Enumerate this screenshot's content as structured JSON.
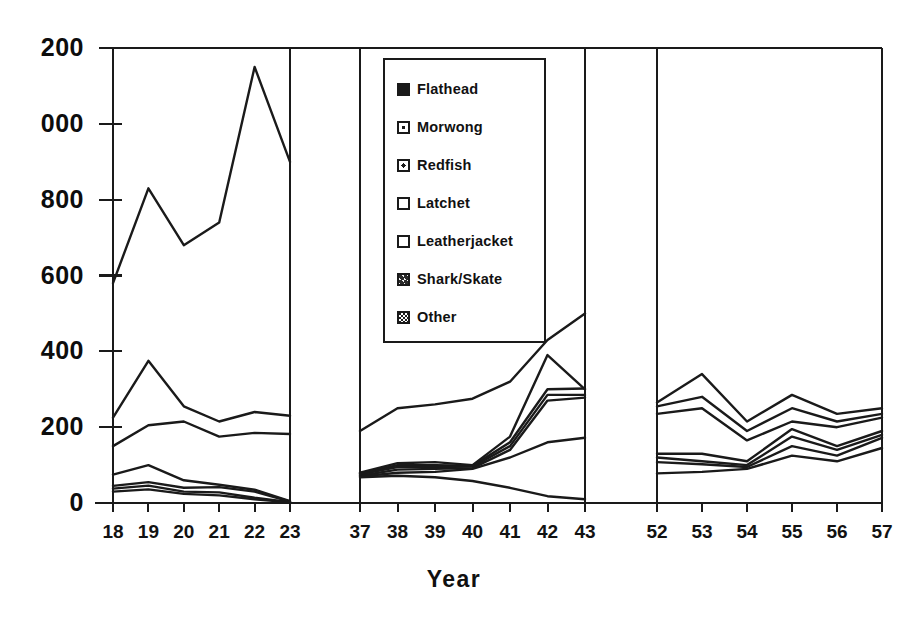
{
  "chart_data": {
    "type": "line",
    "title": "",
    "xlabel": "Year",
    "ylabel": "",
    "ylim": [
      0,
      1200
    ],
    "grid": false,
    "legend_position": "inside-top-center",
    "y_ticks": [
      "200",
      "000",
      "800",
      "600",
      "400",
      "200",
      "0"
    ],
    "y_tick_values": [
      1200,
      1000,
      800,
      600,
      400,
      200,
      0
    ],
    "note_y_labels_clipped": "Leading digit of 1200 and 1000 is cut off at the left image edge",
    "panels": [
      {
        "name": "panel-1",
        "x": [
          "18",
          "19",
          "20",
          "21",
          "22",
          "23"
        ],
        "series": [
          {
            "name": "Flathead",
            "values": [
              580,
              830,
              680,
              740,
              1150,
              900
            ]
          },
          {
            "name": "Morwong",
            "values": [
              225,
              375,
              255,
              215,
              240,
              230
            ]
          },
          {
            "name": "Redfish",
            "values": [
              150,
              205,
              215,
              175,
              185,
              182
            ]
          },
          {
            "name": "Latchet",
            "values": [
              75,
              100,
              60,
              48,
              35,
              5
            ]
          },
          {
            "name": "Leatherjacket",
            "values": [
              45,
              55,
              40,
              42,
              30,
              4
            ]
          },
          {
            "name": "Shark/Skate",
            "values": [
              38,
              46,
              30,
              28,
              14,
              2
            ]
          },
          {
            "name": "Other",
            "values": [
              30,
              36,
              24,
              20,
              10,
              2
            ]
          }
        ]
      },
      {
        "name": "panel-2",
        "x": [
          "37",
          "38",
          "39",
          "40",
          "41",
          "42",
          "43"
        ],
        "series": [
          {
            "name": "Flathead",
            "values": [
              190,
              250,
              260,
              275,
              320,
              430,
              500
            ]
          },
          {
            "name": "Morwong",
            "values": [
              80,
              105,
              108,
              100,
              175,
              390,
              300
            ]
          },
          {
            "name": "Redfish",
            "values": [
              78,
              100,
              100,
              98,
              160,
              300,
              302
            ]
          },
          {
            "name": "Latchet",
            "values": [
              76,
              95,
              95,
              96,
              150,
              285,
              285
            ]
          },
          {
            "name": "Leatherjacket",
            "values": [
              72,
              88,
              90,
              92,
              140,
              270,
              278
            ]
          },
          {
            "name": "Shark/Skate",
            "values": [
              70,
              80,
              82,
              90,
              120,
              160,
              172
            ]
          },
          {
            "name": "Other",
            "values": [
              68,
              72,
              68,
              58,
              40,
              18,
              10
            ]
          }
        ]
      },
      {
        "name": "panel-3",
        "x": [
          "52",
          "53",
          "54",
          "55",
          "56",
          "57"
        ],
        "series": [
          {
            "name": "Flathead",
            "values": [
              265,
              340,
              215,
              285,
              235,
              250
            ]
          },
          {
            "name": "Morwong",
            "values": [
              255,
              280,
              190,
              250,
              215,
              235
            ]
          },
          {
            "name": "Redfish",
            "values": [
              235,
              250,
              165,
              215,
              200,
              225
            ]
          },
          {
            "name": "Latchet",
            "values": [
              130,
              130,
              110,
              195,
              150,
              190
            ]
          },
          {
            "name": "Leatherjacket",
            "values": [
              120,
              110,
              100,
              175,
              140,
              180
            ]
          },
          {
            "name": "Shark/Skate",
            "values": [
              108,
              102,
              95,
              150,
              125,
              172
            ]
          },
          {
            "name": "Other",
            "values": [
              78,
              82,
              90,
              125,
              110,
              145
            ]
          }
        ]
      }
    ]
  },
  "legend": {
    "items": [
      {
        "label": "Flathead",
        "marker": "solid"
      },
      {
        "label": "Morwong",
        "marker": "dot"
      },
      {
        "label": "Redfish",
        "marker": "dot2"
      },
      {
        "label": "Latchet",
        "marker": "open"
      },
      {
        "label": "Leatherjacket",
        "marker": "open"
      },
      {
        "label": "Shark/Skate",
        "marker": "mottle"
      },
      {
        "label": "Other",
        "marker": "check"
      }
    ]
  },
  "colors": {
    "ink": "#1a1a1a",
    "background": "#ffffff"
  }
}
